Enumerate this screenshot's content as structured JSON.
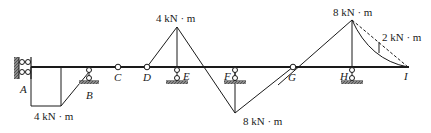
{
  "diagram": {
    "type": "bending-moment-diagram",
    "points": [
      "A",
      "B",
      "C",
      "D",
      "E",
      "F",
      "G",
      "H",
      "I"
    ],
    "labels": {
      "A": "A",
      "B": "B",
      "C": "C",
      "D": "D",
      "E": "E",
      "F": "F",
      "G": "G",
      "H": "H",
      "I": "I"
    },
    "moments": {
      "at_A": "4 kN · m",
      "at_E": "4 kN · m",
      "at_F": "8 kN · m",
      "at_H": "8 kN · m",
      "HI_parabola": "2 kN · m"
    },
    "supports": {
      "A": "fixed (double roller on wall)",
      "B": "roller",
      "E": "roller",
      "F": "roller",
      "H": "roller"
    },
    "hinges": [
      "C",
      "D",
      "G"
    ],
    "colors": {
      "line": "#1a1a1a",
      "hatch": "#555555"
    }
  }
}
